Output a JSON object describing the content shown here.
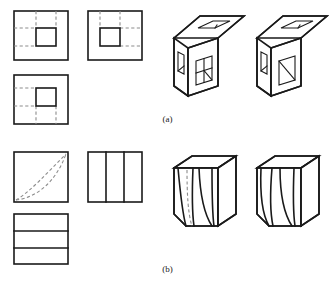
{
  "figure": {
    "caption_a": "(a)",
    "caption_b": "(b)",
    "stroke_color": "#1a1a1a",
    "hidden_line_color": "#8c8c8c",
    "background_color": "#ffffff"
  },
  "part_a": {
    "label": "(a)",
    "orthographic_views": [
      {
        "name": "top-left-view",
        "outer": {
          "x": 14,
          "y": 11,
          "w": 54,
          "h": 49
        },
        "inner": {
          "x": 36,
          "y": 28,
          "w": 20,
          "h": 18
        },
        "hidden_lines": [
          {
            "orientation": "vertical",
            "x": 36,
            "y1": 11,
            "y2": 28
          },
          {
            "orientation": "vertical",
            "x": 56,
            "y1": 11,
            "y2": 28
          },
          {
            "orientation": "horizontal",
            "y": 28,
            "x1": 14,
            "x2": 36
          },
          {
            "orientation": "horizontal",
            "y": 46,
            "x1": 14,
            "x2": 36
          }
        ]
      },
      {
        "name": "top-right-view",
        "outer": {
          "x": 88,
          "y": 11,
          "w": 54,
          "h": 49
        },
        "inner": {
          "x": 100,
          "y": 28,
          "w": 20,
          "h": 18
        },
        "hidden_lines": [
          {
            "orientation": "vertical",
            "x": 100,
            "y1": 11,
            "y2": 28
          },
          {
            "orientation": "vertical",
            "x": 120,
            "y1": 11,
            "y2": 28
          },
          {
            "orientation": "horizontal",
            "y": 28,
            "x1": 120,
            "x2": 142
          },
          {
            "orientation": "horizontal",
            "y": 46,
            "x1": 120,
            "x2": 142
          }
        ]
      },
      {
        "name": "bottom-left-view",
        "outer": {
          "x": 14,
          "y": 75,
          "w": 54,
          "h": 49
        },
        "inner": {
          "x": 36,
          "y": 88,
          "w": 20,
          "h": 18
        },
        "hidden_lines": [
          {
            "orientation": "vertical",
            "x": 36,
            "y1": 106,
            "y2": 124
          },
          {
            "orientation": "vertical",
            "x": 56,
            "y1": 106,
            "y2": 124
          },
          {
            "orientation": "horizontal",
            "y": 88,
            "x1": 14,
            "x2": 36
          },
          {
            "orientation": "horizontal",
            "y": 106,
            "x1": 14,
            "x2": 36
          }
        ]
      }
    ],
    "isometric_solids": [
      {
        "name": "cube-left",
        "description": "cube with rectangular slot on top face, slot on left face, square hole on front face divided into quadrants with diagonal",
        "front_hole_style": "cross-and-diagonal"
      },
      {
        "name": "cube-right",
        "description": "cube with rectangular slot on top face, slot on left face, square hole on front face with single diagonal",
        "front_hole_style": "diagonal"
      }
    ]
  },
  "part_b": {
    "label": "(b)",
    "orthographic_views": [
      {
        "name": "curve-view",
        "outer": {
          "x": 14,
          "y": 152,
          "w": 54,
          "h": 50
        },
        "hidden_curves": [
          {
            "name": "upper-curve",
            "from": [
              14,
              200
            ],
            "to": [
              66,
              154
            ]
          },
          {
            "name": "lower-curve",
            "from": [
              14,
              200
            ],
            "to": [
              66,
              154
            ]
          }
        ]
      },
      {
        "name": "vertical-division-view",
        "outer": {
          "x": 88,
          "y": 152,
          "w": 54,
          "h": 50
        },
        "internal_lines": [
          {
            "orientation": "vertical",
            "x": 106
          },
          {
            "orientation": "vertical",
            "x": 124
          }
        ]
      },
      {
        "name": "horizontal-division-view",
        "outer": {
          "x": 14,
          "y": 214,
          "w": 54,
          "h": 50
        },
        "internal_lines": [
          {
            "orientation": "horizontal",
            "y": 231
          },
          {
            "orientation": "horizontal",
            "y": 248
          }
        ]
      }
    ],
    "isometric_solids": [
      {
        "name": "solid-left",
        "description": "block with chamfered lower-left corner and curved surfaces, one hidden dashed curve visible",
        "has_hidden_curve": true
      },
      {
        "name": "solid-right",
        "description": "block with chamfered lower-left corner and curved surfaces, all curves visible as solid lines",
        "has_hidden_curve": false
      }
    ]
  }
}
